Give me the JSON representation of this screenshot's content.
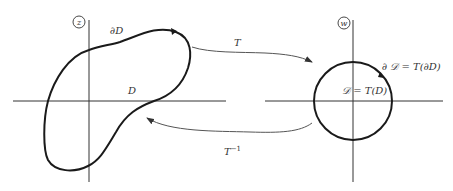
{
  "diagram": {
    "z_plane": {
      "plane_label": "z",
      "region_label": "D",
      "boundary_label": "∂D"
    },
    "w_plane": {
      "plane_label": "w",
      "region_label": "𝒟 = T(D)",
      "boundary_label": "∂ 𝒟 = T(∂D)"
    },
    "forward_map": {
      "label": "T",
      "direction": "z-plane → w-plane"
    },
    "inverse_map": {
      "label_base": "T",
      "label_exponent": "−1",
      "direction": "w-plane → z-plane"
    }
  }
}
